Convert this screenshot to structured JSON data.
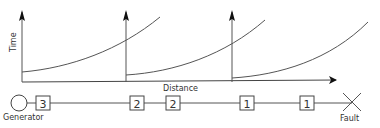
{
  "diagram": {
    "type": "protection-coordination",
    "axes": {
      "y_label": "Time",
      "x_label": "Distance"
    },
    "curves": [
      {
        "name": "curve-relay-3",
        "start_x": 22,
        "end_x": 160
      },
      {
        "name": "curve-relay-2",
        "start_x": 126,
        "end_x": 265
      },
      {
        "name": "curve-relay-1",
        "start_x": 232,
        "end_x": 368
      }
    ],
    "network": {
      "source_label": "Generator",
      "fault_label": "Fault",
      "relays": [
        "3",
        "2",
        "2",
        "1",
        "1"
      ]
    },
    "colors": {
      "line": "#333333",
      "curve": "#555555",
      "background": "#ffffff"
    }
  }
}
